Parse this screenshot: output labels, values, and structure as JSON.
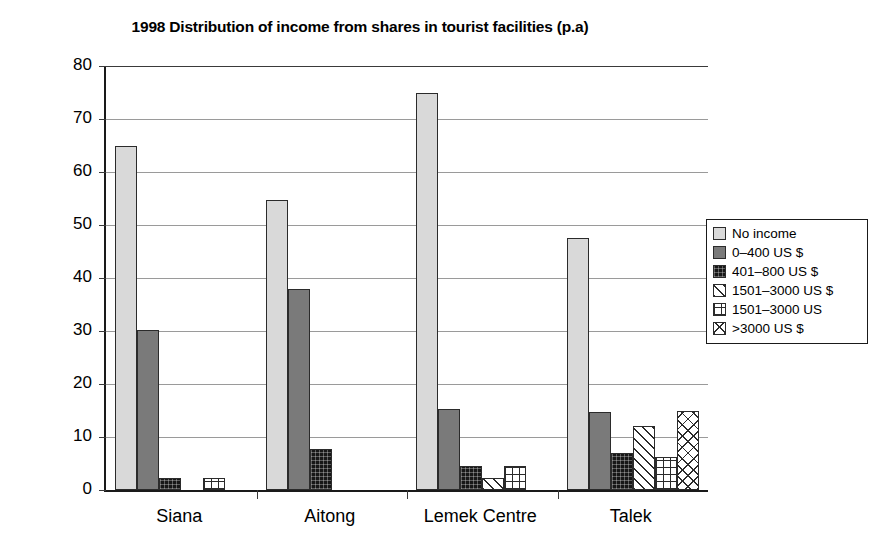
{
  "chart_data": {
    "type": "bar",
    "title": "1998 Distribution of income from shares in tourist facilities (p.a)",
    "xlabel": "",
    "ylabel": "% of sample",
    "ylim": [
      0,
      80
    ],
    "ytick_step": 10,
    "yticks": [
      "0",
      "10",
      "20",
      "30",
      "40",
      "50",
      "60",
      "70",
      "80"
    ],
    "grid": true,
    "legend_position": "right",
    "categories": [
      "Siana",
      "Aitong",
      "Lemek Centre",
      "Talek"
    ],
    "series": [
      {
        "name": "No income",
        "values": [
          65.0,
          54.7,
          74.9,
          47.5
        ]
      },
      {
        "name": "0–400 US $",
        "values": [
          30.2,
          38.0,
          15.2,
          14.7
        ]
      },
      {
        "name": "401–800 US $",
        "values": [
          2.3,
          7.7,
          4.5,
          7.0
        ]
      },
      {
        "name": "1501–3000 US $",
        "values": [
          0,
          0,
          2.2,
          12.0
        ]
      },
      {
        "name": "1501–3000 US",
        "values": [
          2.3,
          0,
          4.5,
          6.2
        ]
      },
      {
        "name": ">3000 US $",
        "values": [
          0,
          0,
          0,
          15.0
        ]
      }
    ],
    "swatch_patterns": [
      "solid-light-gray",
      "solid-medium-gray",
      "solid-black",
      "diagonal-hatch",
      "grid-hatch",
      "cross-hatch"
    ],
    "colors": {
      "series0": "#d9d9d9",
      "series1": "#7a7a7a",
      "series2": "#171717",
      "axis": "#1a1a1a",
      "gridline": "#9a9a9a",
      "background": "#ffffff"
    }
  },
  "legend": {
    "items": [
      {
        "label": "No income"
      },
      {
        "label": "0–400 US $"
      },
      {
        "label": "401–800 US $"
      },
      {
        "label": "1501–3000 US $"
      },
      {
        "label": "1501–3000 US"
      },
      {
        "label": ">3000 US $"
      }
    ]
  }
}
